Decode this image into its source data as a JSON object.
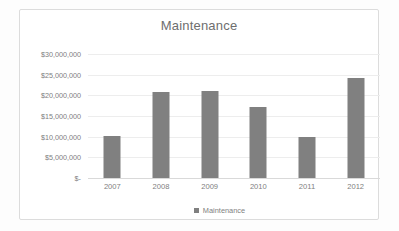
{
  "chart_data": {
    "type": "bar",
    "title": "Maintenance",
    "xlabel": "",
    "ylabel": "",
    "categories": [
      "2007",
      "2008",
      "2009",
      "2010",
      "2011",
      "2012"
    ],
    "values": [
      10200000,
      20700000,
      21000000,
      17200000,
      10000000,
      24300000
    ],
    "series": [
      {
        "name": "Maintenance",
        "values": [
          10200000,
          20700000,
          21000000,
          17200000,
          10000000,
          24300000
        ]
      }
    ],
    "ylim": [
      0,
      30000000
    ],
    "ytick_values": [
      0,
      5000000,
      10000000,
      15000000,
      20000000,
      25000000,
      30000000
    ],
    "ytick_labels": [
      "$-",
      "$5,000,000",
      "$10,000,000",
      "$15,000,000",
      "$20,000,000",
      "$25,000,000",
      "$30,000,000"
    ],
    "grid": true,
    "legend_position": "bottom",
    "legend_entries": [
      "Maintenance"
    ],
    "colors": {
      "bar": "#808080",
      "gridline": "#ededed",
      "axis": "#d9d9d9",
      "text": "#808080",
      "title": "#6e6e6e",
      "plot_background": "#ffffff",
      "frame_border": "#dcdcdc"
    }
  },
  "legend": {
    "marker_icon": "square-marker-icon",
    "label": "Maintenance"
  }
}
